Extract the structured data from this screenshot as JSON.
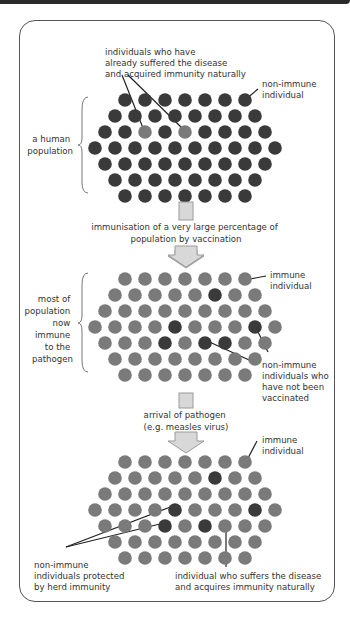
{
  "colors": {
    "non_immune": "#3a3a3a",
    "immune": "#7a7a7a",
    "arrow_fill": "#d8d8d8",
    "arrow_stroke": "#9a9a9a",
    "frame": "#555555",
    "text": "#333333"
  },
  "panel1": {
    "label_lines": [
      "a human",
      "population"
    ],
    "callout_top": [
      "individuals who have",
      "already suffered the disease",
      "and acquired immunity naturally"
    ],
    "callout_right": [
      "non-immune",
      "individual"
    ],
    "rows": [
      [
        0,
        0,
        0,
        0,
        0,
        0,
        0
      ],
      [
        0,
        0,
        0,
        0,
        0,
        0,
        0,
        0
      ],
      [
        0,
        0,
        1,
        0,
        1,
        0,
        0,
        0,
        0
      ],
      [
        0,
        0,
        0,
        0,
        0,
        0,
        0,
        0,
        0,
        0
      ],
      [
        0,
        0,
        0,
        0,
        0,
        0,
        0,
        0,
        0
      ],
      [
        0,
        0,
        0,
        0,
        0,
        0,
        0,
        0
      ],
      [
        0,
        0,
        0,
        0,
        0,
        0,
        0
      ]
    ]
  },
  "step1": {
    "text_lines": [
      "immunisation of a very large percentage of",
      "population by vaccination"
    ]
  },
  "panel2": {
    "label_lines": [
      "most of",
      "population",
      "now",
      "immune",
      "to the",
      "pathogen"
    ],
    "callout_immune": [
      "immune",
      "individual"
    ],
    "callout_nonimmune": [
      "non-immune",
      "individuals who",
      "have not been",
      "vaccinated"
    ],
    "rows": [
      [
        1,
        1,
        1,
        1,
        1,
        1,
        1
      ],
      [
        1,
        1,
        1,
        1,
        1,
        0,
        1,
        1
      ],
      [
        1,
        1,
        1,
        1,
        1,
        1,
        1,
        1,
        1
      ],
      [
        1,
        1,
        1,
        1,
        0,
        1,
        1,
        1,
        0,
        1
      ],
      [
        1,
        1,
        1,
        0,
        1,
        0,
        0,
        1,
        1
      ],
      [
        1,
        1,
        1,
        1,
        1,
        1,
        1,
        1
      ],
      [
        1,
        1,
        1,
        1,
        1,
        1,
        1
      ]
    ]
  },
  "step2": {
    "text_lines": [
      "arrival of pathogen",
      "(e.g. measles virus)"
    ]
  },
  "panel3": {
    "callout_immune": [
      "immune",
      "individual"
    ],
    "callout_protected": [
      "non-immune",
      "individuals protected",
      "by herd immunity"
    ],
    "callout_suffers": [
      "individual who suffers the disease",
      "and acquires immunity naturally"
    ],
    "rows": [
      [
        1,
        1,
        1,
        1,
        1,
        1,
        1
      ],
      [
        1,
        1,
        1,
        1,
        1,
        0,
        1,
        1
      ],
      [
        1,
        1,
        1,
        1,
        1,
        1,
        1,
        1,
        1
      ],
      [
        1,
        1,
        1,
        1,
        0,
        1,
        1,
        1,
        0,
        1
      ],
      [
        1,
        1,
        1,
        0,
        1,
        0,
        1,
        1,
        1
      ],
      [
        1,
        1,
        1,
        1,
        1,
        1,
        1,
        1
      ],
      [
        1,
        1,
        1,
        1,
        1,
        1,
        1
      ]
    ]
  }
}
